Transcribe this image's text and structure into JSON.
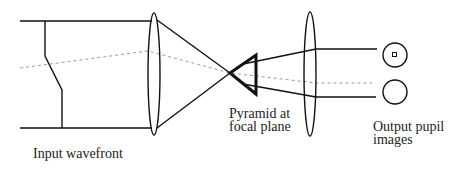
{
  "diagram": {
    "labels": {
      "input": "Input wavefront",
      "pyramid_line1": "Pyramid at",
      "pyramid_line2": "focal plane",
      "output_line1": "Output pupil",
      "output_line2": "images"
    },
    "colors": {
      "line": "#111111",
      "dashed": "#9a9a9a",
      "background": "#ffffff"
    }
  }
}
